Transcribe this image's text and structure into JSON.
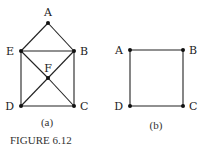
{
  "figure": {
    "caption": "FIGURE 6.12",
    "graphs": [
      {
        "id": "a",
        "sublabel": "(a)",
        "vertices": [
          "A",
          "B",
          "C",
          "D",
          "E",
          "F"
        ],
        "edges": [
          [
            "A",
            "E"
          ],
          [
            "A",
            "B"
          ],
          [
            "E",
            "B"
          ],
          [
            "E",
            "D"
          ],
          [
            "B",
            "C"
          ],
          [
            "D",
            "C"
          ],
          [
            "E",
            "F"
          ],
          [
            "F",
            "C"
          ],
          [
            "B",
            "F"
          ],
          [
            "F",
            "D"
          ]
        ]
      },
      {
        "id": "b",
        "sublabel": "(b)",
        "vertices": [
          "A",
          "B",
          "C",
          "D"
        ],
        "edges": [
          [
            "A",
            "B"
          ],
          [
            "B",
            "C"
          ],
          [
            "C",
            "D"
          ],
          [
            "D",
            "A"
          ]
        ]
      }
    ]
  }
}
